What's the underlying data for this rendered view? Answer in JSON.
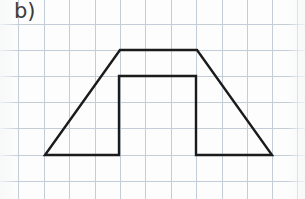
{
  "page": {
    "width": 305,
    "height": 199,
    "background_color": "#fdfdfd",
    "label": "b)"
  },
  "grid": {
    "name": "graph-paper-grid",
    "line_color": "#c3cdd8",
    "cell_width": 25.4,
    "cell_height": 25.8,
    "vertical_line_x": [
      18,
      44,
      69,
      95,
      120,
      145,
      171,
      196,
      222,
      247,
      272,
      297
    ],
    "horizontal_line_y": [
      24,
      50,
      76,
      102,
      128,
      155,
      181
    ]
  },
  "figure": {
    "name": "trapezoid-with-rectangular-notch",
    "stroke_color": "#1b1b1b",
    "stroke_width": 2.4,
    "fill": "none",
    "outline_points": "45,155 120,50 197,50 272,155 196,155 196,76 119,76 119,155",
    "vertices": [
      {
        "name": "bottom-left",
        "x": 45,
        "y": 155
      },
      {
        "name": "top-left",
        "x": 120,
        "y": 50
      },
      {
        "name": "top-right",
        "x": 197,
        "y": 50
      },
      {
        "name": "bottom-right",
        "x": 272,
        "y": 155
      },
      {
        "name": "notch-base-right",
        "x": 196,
        "y": 155
      },
      {
        "name": "notch-top-right",
        "x": 196,
        "y": 76
      },
      {
        "name": "notch-top-left",
        "x": 119,
        "y": 76
      },
      {
        "name": "notch-base-left",
        "x": 119,
        "y": 155
      }
    ],
    "segments": [
      {
        "name": "left-slant-side",
        "from": "bottom-left",
        "to": "top-left"
      },
      {
        "name": "top-side",
        "from": "top-left",
        "to": "top-right"
      },
      {
        "name": "right-slant-side",
        "from": "top-right",
        "to": "bottom-right"
      },
      {
        "name": "base-right-segment",
        "from": "bottom-right",
        "to": "notch-base-right"
      },
      {
        "name": "notch-right-side",
        "from": "notch-base-right",
        "to": "notch-top-right"
      },
      {
        "name": "notch-top-side",
        "from": "notch-top-right",
        "to": "notch-top-left"
      },
      {
        "name": "notch-left-side",
        "from": "notch-top-left",
        "to": "notch-base-left"
      },
      {
        "name": "base-left-segment",
        "from": "notch-base-left",
        "to": "bottom-left"
      }
    ]
  }
}
